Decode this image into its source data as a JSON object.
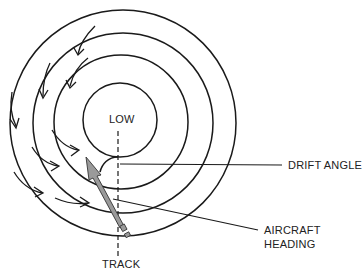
{
  "diagram": {
    "center_label": "LOW",
    "labels": {
      "drift_angle": "DRIFT ANGLE",
      "aircraft_heading_line1": "AIRCRAFT",
      "aircraft_heading_line2": "HEADING",
      "track": "TRACK"
    },
    "elements": {
      "isobars": 4,
      "wind_arrows": 10,
      "aircraft_arrow_color": "#9a9a9a",
      "line_color": "#1a1a1a"
    }
  }
}
